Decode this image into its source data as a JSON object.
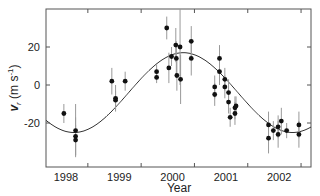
{
  "chart_data": {
    "type": "scatter",
    "title": "",
    "xlabel": "Year",
    "ylabel": "v_r (m s^-1)",
    "ylabel_parts": {
      "main": "v",
      "sub": "r",
      "units": " (m s",
      "sup": "-1",
      "close": ")"
    },
    "xlim": [
      1997.62,
      2002.6
    ],
    "ylim": [
      -43,
      40
    ],
    "x_ticks": [
      1998,
      1999,
      2000,
      2001,
      2002
    ],
    "x_tick_labels": [
      "1998",
      "1999",
      "2000",
      "2001",
      "2002"
    ],
    "y_ticks": [
      -20,
      0,
      20
    ],
    "y_tick_labels": [
      "-20",
      "0",
      "20"
    ],
    "grid": false,
    "legend": null,
    "series": [
      {
        "name": "observations",
        "marker": "filled-circle",
        "color": "#111111",
        "errorbar_color": "#999999",
        "points": [
          {
            "x": 1997.96,
            "y": -15,
            "err": 5
          },
          {
            "x": 1998.18,
            "y": -24,
            "err": 14
          },
          {
            "x": 1998.18,
            "y": -27,
            "err": 10
          },
          {
            "x": 1998.18,
            "y": -29,
            "err": 8
          },
          {
            "x": 1998.86,
            "y": 2,
            "err": 7
          },
          {
            "x": 1998.93,
            "y": -7,
            "err": 7
          },
          {
            "x": 1998.93,
            "y": -8,
            "err": 5
          },
          {
            "x": 1999.11,
            "y": 2,
            "err": 5
          },
          {
            "x": 1999.7,
            "y": 7,
            "err": 4
          },
          {
            "x": 1999.7,
            "y": 4,
            "err": 3
          },
          {
            "x": 1999.89,
            "y": 30,
            "err": 6
          },
          {
            "x": 1999.93,
            "y": 9,
            "err": 8
          },
          {
            "x": 1999.98,
            "y": 15,
            "err": 5
          },
          {
            "x": 2000.06,
            "y": 21,
            "err": 9
          },
          {
            "x": 2000.07,
            "y": 14,
            "err": 9
          },
          {
            "x": 2000.08,
            "y": 5,
            "err": 8
          },
          {
            "x": 2000.14,
            "y": 20,
            "err": 20
          },
          {
            "x": 2000.15,
            "y": 3,
            "err": 13
          },
          {
            "x": 2000.35,
            "y": 23,
            "err": 8
          },
          {
            "x": 2000.35,
            "y": 14,
            "err": 9
          },
          {
            "x": 2000.79,
            "y": -1,
            "err": 6
          },
          {
            "x": 2000.79,
            "y": -5,
            "err": 6
          },
          {
            "x": 2000.88,
            "y": 14,
            "err": 7
          },
          {
            "x": 2000.88,
            "y": 7,
            "err": 7
          },
          {
            "x": 2000.98,
            "y": 3,
            "err": 6
          },
          {
            "x": 2000.98,
            "y": -1,
            "err": 6
          },
          {
            "x": 2001.05,
            "y": -4,
            "err": 7
          },
          {
            "x": 2001.05,
            "y": -9,
            "err": 6
          },
          {
            "x": 2001.08,
            "y": -17,
            "err": 5
          },
          {
            "x": 2001.17,
            "y": -15,
            "err": 6
          },
          {
            "x": 2001.17,
            "y": -12,
            "err": 6
          },
          {
            "x": 2001.19,
            "y": -11,
            "err": 5
          },
          {
            "x": 2001.8,
            "y": -21,
            "err": 7
          },
          {
            "x": 2001.8,
            "y": -28,
            "err": 8
          },
          {
            "x": 2001.89,
            "y": -24,
            "err": 5
          },
          {
            "x": 2001.98,
            "y": -22,
            "err": 6
          },
          {
            "x": 2001.98,
            "y": -26,
            "err": 7
          },
          {
            "x": 2002.04,
            "y": -19,
            "err": 7
          },
          {
            "x": 2002.14,
            "y": -24,
            "err": 4
          },
          {
            "x": 2002.37,
            "y": -21,
            "err": 7
          },
          {
            "x": 2002.37,
            "y": -26,
            "err": 7
          }
        ]
      },
      {
        "name": "orbital-fit",
        "type": "line",
        "color": "#333333",
        "model": {
          "amplitude": 21,
          "offset": -4,
          "period_years": 4.1,
          "peak_year": 2000.2
        }
      }
    ]
  }
}
